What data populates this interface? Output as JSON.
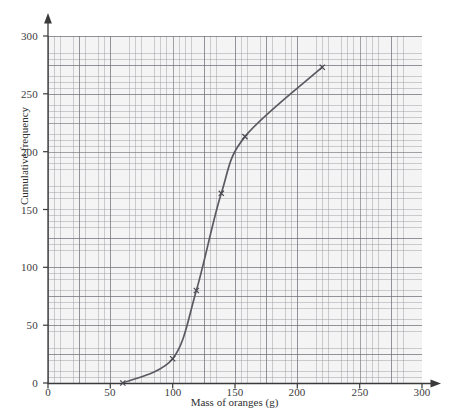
{
  "chart_data": {
    "type": "line",
    "title": "",
    "subtitle": "",
    "xlabel": "Mass of oranges (g)",
    "ylabel": "Cumulative frequency",
    "xlim": [
      0,
      300
    ],
    "ylim": [
      0,
      300
    ],
    "xticks": [
      0,
      50,
      100,
      150,
      200,
      250,
      300
    ],
    "yticks": [
      0,
      50,
      100,
      150,
      200,
      250,
      300
    ],
    "xtick_labels": [
      "0",
      "50",
      "100",
      "150",
      "200",
      "250",
      "300"
    ],
    "ytick_labels": [
      "0",
      "50",
      "100",
      "150",
      "200",
      "250",
      "300"
    ],
    "grid": true,
    "grid_minor_step_x": 5,
    "grid_minor_step_y": 5,
    "grid_major_step_x": 25,
    "grid_major_step_y": 25,
    "legend": null,
    "legend_position": "none",
    "annotations": [],
    "series": [
      {
        "name": "Cumulative frequency of orange masses",
        "marker": "cross",
        "color": "#5a5a62",
        "x": [
          60,
          100,
          119,
          139,
          158,
          220
        ],
        "y": [
          0,
          21,
          80,
          164,
          213,
          273
        ],
        "points": [
          {
            "x": 60,
            "y": 0
          },
          {
            "x": 100,
            "y": 21
          },
          {
            "x": 119,
            "y": 80
          },
          {
            "x": 139,
            "y": 164
          },
          {
            "x": 158,
            "y": 213
          },
          {
            "x": 220,
            "y": 273
          }
        ]
      }
    ]
  },
  "axes": {
    "x_title": "Mass of oranges (g)",
    "y_title": "Cumulative frequency",
    "x_labels": [
      "0",
      "50",
      "100",
      "150",
      "200",
      "250",
      "300"
    ],
    "y_labels": [
      "0",
      "50",
      "100",
      "150",
      "200",
      "250",
      "300"
    ],
    "x_arrow": "arrow-right-icon",
    "y_arrow": "arrow-up-icon"
  },
  "colors": {
    "curve": "#5a5a62",
    "axis": "#3a3a3a",
    "grid_major": "#6e6e76",
    "grid_minor": "#8c8c94",
    "paper": "#f4f4f4",
    "background": "#ffffff",
    "text": "#2f2f2f"
  }
}
